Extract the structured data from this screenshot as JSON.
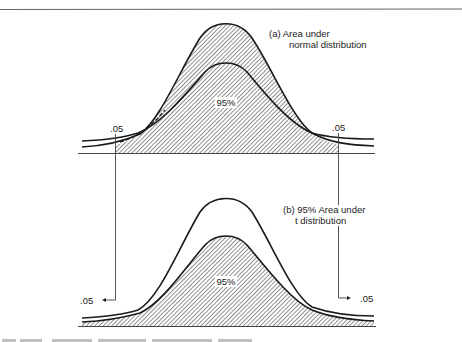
{
  "figure": {
    "panel_a": {
      "label_line1": "(a)  Area under",
      "label_line2": "normal distribution",
      "center_label": "95%",
      "left_tail_label": ".05",
      "right_tail_label": ".05"
    },
    "panel_b": {
      "label_line1": "(b)  95% Area under",
      "label_line2": "t distribution",
      "center_label": "95%",
      "left_tail_label": ".05",
      "right_tail_label": ".05"
    },
    "colors": {
      "ink": "#1a1a1a",
      "hatch": "#555555",
      "rule": "#666666",
      "background": "#ffffff"
    }
  }
}
